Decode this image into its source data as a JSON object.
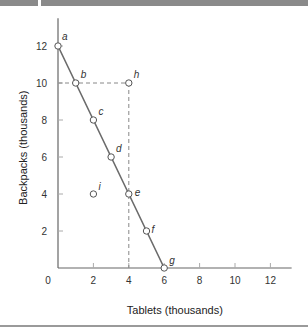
{
  "chart_data": {
    "type": "line",
    "title": "",
    "xlabel": "Tablets (thousands)",
    "ylabel": "Backpacks (thousands)",
    "xlim": [
      0,
      13
    ],
    "ylim": [
      0,
      13
    ],
    "x_ticks": [
      "0",
      "2",
      "4",
      "6",
      "8",
      "10",
      "12"
    ],
    "y_ticks": [
      "2",
      "4",
      "6",
      "8",
      "10",
      "12"
    ],
    "grid": false,
    "series": [
      {
        "name": "Production possibilities frontier",
        "points": [
          {
            "label": "a",
            "x": 0,
            "y": 12
          },
          {
            "label": "b",
            "x": 1,
            "y": 10
          },
          {
            "label": "c",
            "x": 2,
            "y": 8
          },
          {
            "label": "d",
            "x": 3,
            "y": 6
          },
          {
            "label": "e",
            "x": 4,
            "y": 4
          },
          {
            "label": "f",
            "x": 5,
            "y": 2
          },
          {
            "label": "g",
            "x": 6,
            "y": 0
          }
        ]
      }
    ],
    "other_points": [
      {
        "label": "h",
        "x": 4,
        "y": 10
      },
      {
        "label": "i",
        "x": 2,
        "y": 4
      }
    ],
    "guide_lines": [
      {
        "from": {
          "x": 0,
          "y": 10
        },
        "to": {
          "x": 4,
          "y": 10
        },
        "style": "dashed"
      },
      {
        "from": {
          "x": 4,
          "y": 10
        },
        "to": {
          "x": 4,
          "y": 0
        },
        "style": "dashed"
      }
    ],
    "colors": {
      "line": "#6b6b6b",
      "marker_fill": "#ffffff",
      "axis": "#666666"
    }
  }
}
